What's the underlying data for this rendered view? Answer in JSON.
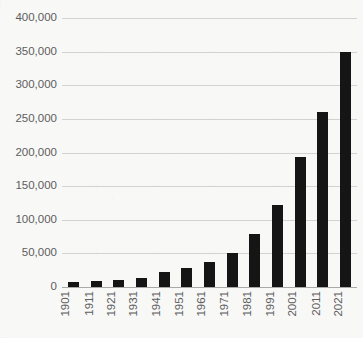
{
  "chart_data": {
    "type": "bar",
    "title": "",
    "xlabel": "",
    "ylabel": "",
    "ylim": [
      0,
      400000
    ],
    "ytick_step": 50000,
    "grid": true,
    "legend_position": "none",
    "bar_color": "#151515",
    "gridline_color": "#d2d2d2",
    "axis_color": "#a9a9a9",
    "background_color": "#f8f8f7",
    "label_color": "#5d5d5d",
    "categories": [
      "1901",
      "1911",
      "1921",
      "1931",
      "1941",
      "1951",
      "1961",
      "1971",
      "1981",
      "1991",
      "2001",
      "2011",
      "2021"
    ],
    "values": [
      7500,
      9000,
      11000,
      13500,
      22000,
      29000,
      37000,
      50000,
      79000,
      122000,
      193000,
      260000,
      350000
    ],
    "ytick_labels": [
      "400,000",
      "350,000",
      "300,000",
      "250,000",
      "200,000",
      "150,000",
      "100,000",
      "50,000",
      "0"
    ],
    "ytick_values": [
      400000,
      350000,
      300000,
      250000,
      200000,
      150000,
      100000,
      50000,
      0
    ]
  }
}
